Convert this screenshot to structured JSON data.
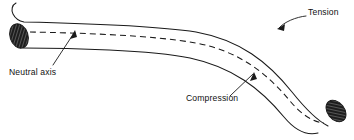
{
  "figure": {
    "background_color": "#ffffff",
    "line_color": "#1a1a1a",
    "hatch_color": "#2b2b2b",
    "width": 354,
    "height": 140
  },
  "labels": {
    "tension": "Tension",
    "compression": "Compression",
    "neutral_axis": "Neutral axis"
  },
  "annotations": [
    {
      "name": "tension",
      "text": "Tension",
      "text_x": 308,
      "text_y": 15,
      "anchor": "start",
      "arrow_tip_x": 277,
      "arrow_tip_y": 29,
      "leader": "M 306 16 C 296 17 284 22 279 28"
    },
    {
      "name": "compression",
      "text": "Compression",
      "text_x": 186,
      "text_y": 101,
      "anchor": "start",
      "arrow_tip_x": 254,
      "arrow_tip_y": 72,
      "leader": "M 230 96 L 253 74"
    },
    {
      "name": "neutral-axis",
      "text": "Neutral axis",
      "text_x": 9,
      "text_y": 75,
      "anchor": "start",
      "arrow_tip_x": 75,
      "arrow_tip_y": 31,
      "leader": "M 53 65 L 74 33"
    }
  ],
  "beam": {
    "top_edge_path": "M 16 3 C 12 5 11 10 13 14 C 15 18 19 21 24 22 C 70 23 150 25 196 32 C 240 40 268 62 292 92 C 304 107 316 120 328 126",
    "bottom_edge_path": "M 23 48 C 70 48 150 50 190 58 C 232 67 260 88 284 117 C 294 129 306 136 318 133",
    "neutral_axis_path": "M 30 32 C 80 33 150 35 196 43 C 238 51 266 72 290 101 C 300 113 312 122 324 123",
    "left_cross_section": {
      "cx": 19,
      "cy": 36,
      "rx": 9,
      "ry": 12.5,
      "rotation": -18
    },
    "right_cross_section": {
      "cx": 336,
      "cy": 111,
      "rx": 8.5,
      "ry": 12,
      "rotation": -38
    }
  }
}
